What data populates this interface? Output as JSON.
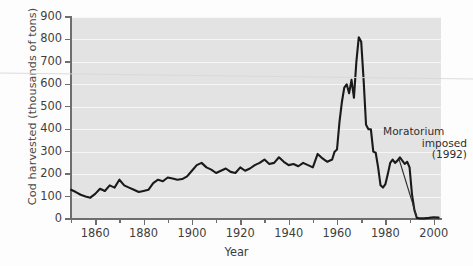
{
  "chart_data": {
    "type": "line",
    "title": "",
    "xlabel": "Year",
    "ylabel": "Cod harvested (thousands of tons)",
    "xlim": [
      1850,
      2003
    ],
    "ylim": [
      0,
      900
    ],
    "grid": true,
    "legend": "none",
    "yticks": [
      0,
      100,
      200,
      300,
      400,
      500,
      600,
      700,
      800,
      900
    ],
    "ytick_labels": [
      "0",
      "100",
      "200",
      "300",
      "400",
      "500",
      "600",
      "700",
      "800",
      "900"
    ],
    "xticks": [
      1860,
      1880,
      1900,
      1920,
      1940,
      1960,
      1980,
      2000
    ],
    "xtick_labels": [
      "1860",
      "1880",
      "1900",
      "1920",
      "1940",
      "1960",
      "1980",
      "2000"
    ],
    "xminor_ticks": [
      1850,
      1870,
      1890,
      1910,
      1930,
      1950,
      1970,
      1990,
      2000
    ],
    "line_color": "#1a1a1a",
    "panel_color": "#e3e3e3",
    "gridline_color": "#f6f6f6",
    "annotations": [
      {
        "name": "moratorium",
        "lines": [
          "Moratorium",
          "imposed",
          "(1992)"
        ],
        "points_to_year": 1993,
        "points_to_value": 0
      }
    ],
    "series": [
      {
        "name": "Cod harvested",
        "x": [
          1850,
          1852,
          1854,
          1856,
          1858,
          1860,
          1862,
          1864,
          1866,
          1868,
          1870,
          1872,
          1874,
          1876,
          1878,
          1880,
          1882,
          1884,
          1886,
          1888,
          1890,
          1892,
          1894,
          1896,
          1898,
          1900,
          1902,
          1904,
          1906,
          1908,
          1910,
          1912,
          1914,
          1916,
          1918,
          1920,
          1922,
          1924,
          1926,
          1928,
          1930,
          1932,
          1934,
          1936,
          1938,
          1940,
          1942,
          1944,
          1946,
          1948,
          1950,
          1952,
          1954,
          1956,
          1958,
          1959,
          1960,
          1961,
          1962,
          1963,
          1964,
          1965,
          1966,
          1967,
          1968,
          1969,
          1970,
          1971,
          1972,
          1973,
          1974,
          1975,
          1976,
          1977,
          1978,
          1979,
          1980,
          1981,
          1982,
          1983,
          1984,
          1985,
          1986,
          1987,
          1988,
          1989,
          1990,
          1991,
          1992,
          1993,
          1994,
          1996,
          1998,
          2000,
          2002
        ],
        "y": [
          130,
          120,
          108,
          100,
          95,
          112,
          135,
          125,
          150,
          140,
          175,
          150,
          140,
          130,
          120,
          125,
          130,
          160,
          175,
          168,
          185,
          180,
          175,
          178,
          190,
          215,
          240,
          250,
          230,
          220,
          205,
          215,
          225,
          210,
          205,
          230,
          215,
          225,
          240,
          250,
          265,
          245,
          250,
          275,
          255,
          240,
          245,
          235,
          250,
          240,
          230,
          290,
          270,
          255,
          265,
          300,
          310,
          430,
          520,
          585,
          600,
          560,
          620,
          540,
          700,
          810,
          790,
          620,
          420,
          400,
          400,
          300,
          295,
          230,
          150,
          140,
          155,
          200,
          250,
          265,
          250,
          260,
          275,
          260,
          245,
          255,
          230,
          110,
          40,
          5,
          3,
          3,
          5,
          8,
          6
        ]
      }
    ]
  }
}
